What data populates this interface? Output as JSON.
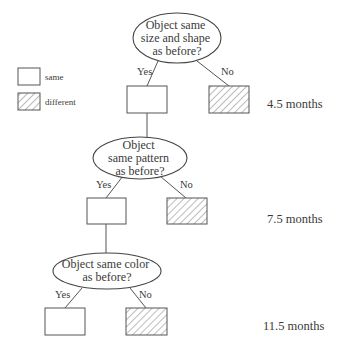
{
  "legend": {
    "items": [
      {
        "label": "same",
        "style": "plain"
      },
      {
        "label": "different",
        "style": "hatched"
      }
    ]
  },
  "nodes": [
    {
      "question_lines": [
        "Object same",
        "size and shape",
        "as before?"
      ],
      "yes_label": "Yes",
      "no_label": "No",
      "age": "4.5 months"
    },
    {
      "question_lines": [
        "Object",
        "same pattern",
        "as before?"
      ],
      "yes_label": "Yes",
      "no_label": "No",
      "age": "7.5 months"
    },
    {
      "question_lines": [
        "Object same color",
        "as before?"
      ],
      "yes_label": "Yes",
      "no_label": "No",
      "age": "11.5 months"
    }
  ],
  "colors": {
    "line": "#555555",
    "text": "#3a3a3a",
    "background": "#ffffff"
  }
}
